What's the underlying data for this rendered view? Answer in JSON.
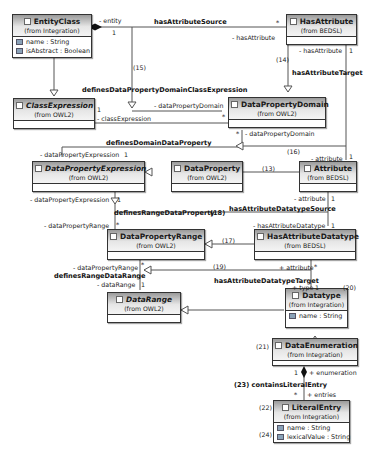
{
  "classes": {
    "entity_class": {
      "name": "EntityClass",
      "from": "(from Integration)",
      "attrs": [
        "name : String",
        "isAbstract : Boolean"
      ]
    },
    "has_attribute": {
      "name": "HasAttribute",
      "from": "(from BEDSL)"
    },
    "class_expression": {
      "name": "ClassExpression",
      "from": "(from OWL2)"
    },
    "data_property_domain": {
      "name": "DataPropertyDomain",
      "from": "(from OWL2)"
    },
    "data_property_expression": {
      "name": "DataPropertyExpression",
      "from": "(from OWL2)"
    },
    "data_property": {
      "name": "DataProperty",
      "from": "(from OWL2)"
    },
    "attribute": {
      "name": "Attribute",
      "from": "(from BEDSL)"
    },
    "data_property_range": {
      "name": "DataPropertyRange",
      "from": "(from OWL2)"
    },
    "has_attribute_datatype": {
      "name": "HasAttributeDatatype",
      "from": "(from BEDSL)"
    },
    "data_range": {
      "name": "DataRange",
      "from": "(from OWL2)"
    },
    "datatype": {
      "name": "Datatype",
      "from": "(from Integration)",
      "attrs": [
        "name : String"
      ]
    },
    "data_enumeration": {
      "name": "DataEnumeration",
      "from": "(from Integration)"
    },
    "literal_entry": {
      "name": "LiteralEntry",
      "from": "(from Integration)",
      "attrs": [
        "name : String",
        "lexicalValue : String"
      ]
    }
  },
  "labels": {
    "entity_role": "- entity",
    "entity_mult": "1",
    "has_attribute_source": "hasAttributeSource",
    "has_attribute_star": "*",
    "has_attribute_role": "- hasAttribute",
    "n15": "(15)",
    "n14": "(14)",
    "has_attribute_role2": "- hasAttribute",
    "has_attribute_mult2": "1",
    "has_attribute_target": "hasAttributeTarget",
    "defines_dpd_ce": "definesDataPropertyDomainClassExpression",
    "ce_mult": "1",
    "ce_role": "- classExpression",
    "dpd_role": "- dataPropertyDomain",
    "dpd_star": "*",
    "dpd_star2": "*",
    "dpd_role2": "- dataPropertyDomain",
    "defines_domain_dp": "definesDomainDataProperty",
    "n16": "(16)",
    "dpe_role": "- dataPropertyExpression",
    "dpe_mult": "1",
    "attr_role": "- attribute",
    "attr_mult": "1",
    "n13": "(13)",
    "attr_role2": "- attribute",
    "attr_mult2": "1",
    "dpe_role2": "- dataPropertyExpression",
    "dpe_mult2": "1",
    "had_source": "hasAttributeDatatypeSource",
    "defines_range_dp": "definesRangeDataProperty",
    "n18": "(18)",
    "dpr_role": "- dataPropertyRange",
    "dpr_star": "*",
    "had_role": "- hasAttributeDatatype",
    "had_mult": "1",
    "n17": "(17)",
    "dpr_role2": "- dataPropertyRange",
    "dpr_star2": "*",
    "n19": "(19)",
    "attr_plus": "+ attribute",
    "attr_plus_star": "*",
    "defines_range_dr": "definesRangeDataRange",
    "had_target": "hasAttributeDatatypeTarget",
    "dr_role": "- dataRange",
    "dr_mult": "1",
    "type_role": "+ type",
    "type_mult": "1",
    "n20": "(20)",
    "n21": "(21)",
    "enum_mult": "1",
    "enum_role": "+ enumeration",
    "n23_contains": "(23) containsLiteralEntry",
    "entries_star": "*",
    "entries_role": "+ entries",
    "n22": "(22)",
    "n24": "(24)"
  }
}
